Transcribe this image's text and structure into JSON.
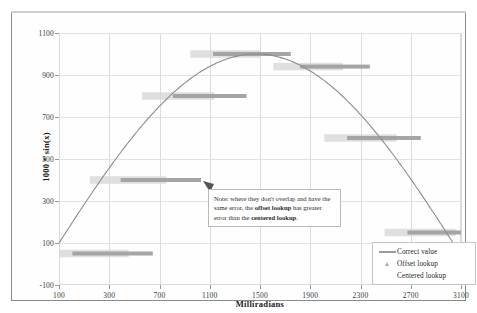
{
  "chart_data": {
    "type": "line",
    "title": "",
    "xlabel": "Milliradians",
    "ylabel": "1000 * sin(x)",
    "xlim": [
      100,
      3100
    ],
    "ylim": [
      -100,
      1100
    ],
    "grid": true,
    "x_ticks": [
      100,
      300,
      700,
      1100,
      1500,
      1900,
      2300,
      2700,
      3100
    ],
    "y_ticks": [
      -100,
      100,
      300,
      500,
      700,
      900,
      1100
    ],
    "legend_position": "bottom-right",
    "series": [
      {
        "name": "Correct value",
        "type": "line",
        "marker": "line",
        "color": "#8c8c8c",
        "description": "1000 * sin(x) smooth sine curve rising from -100 at x=100 to a peak near 1000 around x=1500 and falling to near 100 at x=3100",
        "x": [
          100,
          300,
          500,
          700,
          900,
          1100,
          1300,
          1500,
          1700,
          1900,
          2100,
          2300,
          2500,
          2700,
          2900,
          3100
        ],
        "y": [
          100,
          296,
          479,
          644,
          783,
          891,
          964,
          997,
          991,
          946,
          863,
          746,
          598,
          427,
          239,
          42
        ]
      },
      {
        "name": "Offset lookup",
        "type": "step-band",
        "marker": "triangle",
        "color": "#a0a0a0",
        "description": "Darker quantized step bands shifted right of the centered bands",
        "bands": [
          {
            "x_start": 200,
            "x_end": 800,
            "y": 50
          },
          {
            "x_start": 560,
            "x_end": 1160,
            "y": 400
          },
          {
            "x_start": 950,
            "x_end": 1500,
            "y": 800
          },
          {
            "x_start": 1250,
            "x_end": 1830,
            "y": 1000
          },
          {
            "x_start": 1900,
            "x_end": 2420,
            "y": 940
          },
          {
            "x_start": 2250,
            "x_end": 2800,
            "y": 600
          },
          {
            "x_start": 2700,
            "x_end": 3100,
            "y": 150
          }
        ]
      },
      {
        "name": "Centered lookup",
        "type": "step-band",
        "marker": "band",
        "color": "#d6d6d6",
        "description": "Lighter quantized step bands centered on the true curve",
        "bands": [
          {
            "x_start": 100,
            "x_end": 620,
            "y": 50
          },
          {
            "x_start": 330,
            "x_end": 900,
            "y": 400
          },
          {
            "x_start": 720,
            "x_end": 1260,
            "y": 800
          },
          {
            "x_start": 1080,
            "x_end": 1600,
            "y": 1000
          },
          {
            "x_start": 1700,
            "x_end": 2220,
            "y": 940
          },
          {
            "x_start": 2080,
            "x_end": 2620,
            "y": 600
          },
          {
            "x_start": 2530,
            "x_end": 3060,
            "y": 150
          }
        ]
      }
    ],
    "annotations": [
      {
        "name": "note-callout",
        "text_parts": [
          {
            "text": "Note: where they don't overlap and have the same error, the ",
            "bold": false
          },
          {
            "text": "offset lookup",
            "bold": true
          },
          {
            "text": " has greater error than the ",
            "bold": false
          },
          {
            "text": "centered lookup",
            "bold": true
          },
          {
            "text": ".",
            "bold": false
          }
        ],
        "plain_text": "Note: where they don't overlap and have the same error, the offset lookup has greater error than the centered lookup.",
        "arrow_points_to": {
          "x": 830,
          "y": 400
        }
      }
    ]
  },
  "axes": {
    "y_title": "1000 * sin(x)",
    "x_title": "Milliradians",
    "y_tick_labels": [
      "1100",
      "900",
      "700",
      "500",
      "300",
      "100",
      "-100"
    ],
    "x_tick_labels": [
      "100",
      "300",
      "700",
      "1100",
      "1500",
      "1900",
      "2300",
      "2700",
      "3100"
    ]
  },
  "legend": {
    "items": [
      {
        "label": "Correct value",
        "key": "line-key-icon"
      },
      {
        "label": "Offset lookup",
        "key": "triangle-marker-icon"
      },
      {
        "label": "Centered lookup",
        "key": "band-marker-icon"
      }
    ]
  },
  "note": {
    "p1": "Note: where they don't overlap",
    "p2a": "and have the same error, the ",
    "p2b": "offset",
    "p3a": "lookup",
    "p3b": " has greater error than the",
    "p4a": "centered lookup",
    "p4b": "."
  },
  "colors": {
    "curve": "#8c8c8c",
    "offset_band": "#a0a0a0",
    "centered_band": "#d6d6d6",
    "grid": "#dcdcdc",
    "frame": "#8a8a8a"
  }
}
